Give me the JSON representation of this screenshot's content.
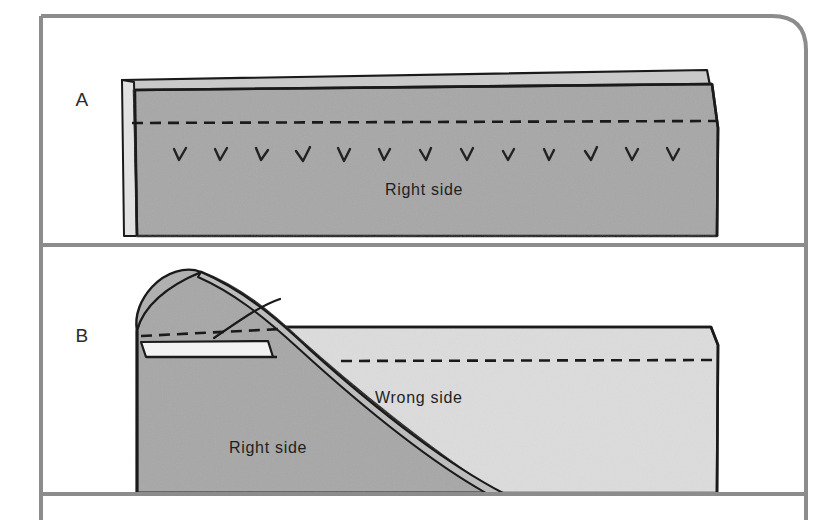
{
  "figure": {
    "panels": [
      {
        "id": "A",
        "letter": "A",
        "labels": [
          {
            "name": "right-side",
            "text": "Right side",
            "x": 385,
            "y": 195
          }
        ],
        "stitch_count": 13,
        "stitch_glyph": "v",
        "description": "Flat fabric band, right side up, with dashed stitch line and row of v stitch marks"
      },
      {
        "id": "B",
        "letter": "B",
        "labels": [
          {
            "name": "wrong-side",
            "text": "Wrong side",
            "x": 375,
            "y": 403
          },
          {
            "name": "right-side",
            "text": "Right side",
            "x": 229,
            "y": 453
          }
        ],
        "description": "Fabric folded back diagonally revealing wrong side, right side visible on the left"
      }
    ]
  },
  "colors": {
    "right_side_fill": "#a7a7a7",
    "right_side_fill_light": "#b4b4b4",
    "wrong_side_fill": "#dcdcdc",
    "paper_white": "#ffffff",
    "frame_gray": "#8c8c8c",
    "ink_black": "#1a1a1a",
    "stitch_ink": "#222222",
    "label_ink": "#1f1f1f"
  },
  "frame": {
    "name": "page-border",
    "left_x": 41,
    "top_y": 16,
    "right_x": 806,
    "corner_radius": 34,
    "divider_a_b_y": 245,
    "bottom_divider_y": 494,
    "stroke_width": 4
  },
  "stitch_line": {
    "name": "dashed-stitch-line",
    "dash_pattern": "11 7",
    "stroke_width": 2.6
  }
}
